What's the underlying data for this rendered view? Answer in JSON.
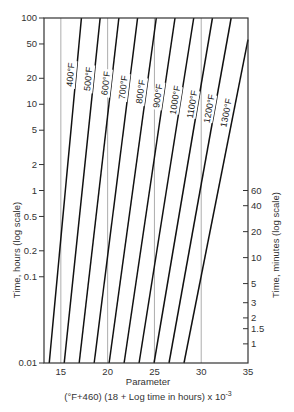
{
  "chart_data": {
    "type": "line",
    "title": "",
    "xlabel": "Parameter",
    "xlabel_formula": "(°F+460) (18 + Log time in hours) x 10",
    "xlabel_exponent": "-3",
    "ylabel": "Time, hours (log scale)",
    "ylabel_right": "Time, minutes (log scale)",
    "xlim": [
      13.2,
      35
    ],
    "ylim": [
      0.01,
      100
    ],
    "yscale": "log",
    "x_ticks": [
      15,
      20,
      25,
      30,
      35
    ],
    "y_ticks": [
      100,
      50,
      20,
      10,
      5,
      2,
      1,
      0.5,
      0.2,
      0.1,
      0.01
    ],
    "y_ticks_right_minutes": [
      60,
      40,
      20,
      10,
      5,
      3,
      2,
      1.5,
      1
    ],
    "vertical_gridlines": [
      15,
      20,
      25,
      30
    ],
    "formula": "P = (T + 460)(18 + log10 t) / 1000",
    "series": [
      {
        "name": "400°F",
        "temp_f": 400,
        "points": [
          [
            13.76,
            0.01
          ],
          [
            17.2,
            100
          ]
        ]
      },
      {
        "name": "500°F",
        "temp_f": 500,
        "points": [
          [
            15.36,
            0.01
          ],
          [
            19.2,
            100
          ]
        ]
      },
      {
        "name": "600°F",
        "temp_f": 600,
        "points": [
          [
            16.96,
            0.01
          ],
          [
            21.2,
            100
          ]
        ]
      },
      {
        "name": "700°F",
        "temp_f": 700,
        "points": [
          [
            18.56,
            0.01
          ],
          [
            23.2,
            100
          ]
        ]
      },
      {
        "name": "800°F",
        "temp_f": 800,
        "points": [
          [
            20.16,
            0.01
          ],
          [
            25.2,
            100
          ]
        ]
      },
      {
        "name": "900°F",
        "temp_f": 900,
        "points": [
          [
            21.76,
            0.01
          ],
          [
            27.2,
            100
          ]
        ]
      },
      {
        "name": "1000°F",
        "temp_f": 1000,
        "points": [
          [
            23.36,
            0.01
          ],
          [
            29.2,
            100
          ]
        ]
      },
      {
        "name": "1100°F",
        "temp_f": 1100,
        "points": [
          [
            24.96,
            0.01
          ],
          [
            31.2,
            100
          ]
        ]
      },
      {
        "name": "1200°F",
        "temp_f": 1200,
        "points": [
          [
            26.56,
            0.01
          ],
          [
            33.2,
            100
          ]
        ]
      },
      {
        "name": "1300°F",
        "temp_f": 1300,
        "points": [
          [
            28.16,
            0.01
          ],
          [
            35.0,
            56
          ]
        ]
      }
    ],
    "grid": false,
    "legend": "inline labels along lines"
  }
}
